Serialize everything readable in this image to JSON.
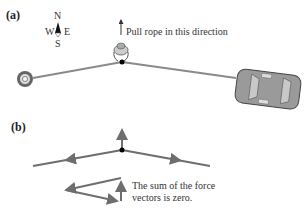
{
  "panel_a": {
    "label": "(a)",
    "compass": {
      "n": "N",
      "s": "S",
      "e": "E",
      "w": "W"
    },
    "instruction": "Pull rope in this direction"
  },
  "panel_b": {
    "label": "(b)",
    "caption_line1": "The sum of the force",
    "caption_line2": "vectors is zero."
  },
  "colors": {
    "rope": "#8a8a8a",
    "vector": "#6e6e6e",
    "knot": "#000000",
    "car_body": "#9a9a9a",
    "car_glass": "#c8c8c8"
  }
}
